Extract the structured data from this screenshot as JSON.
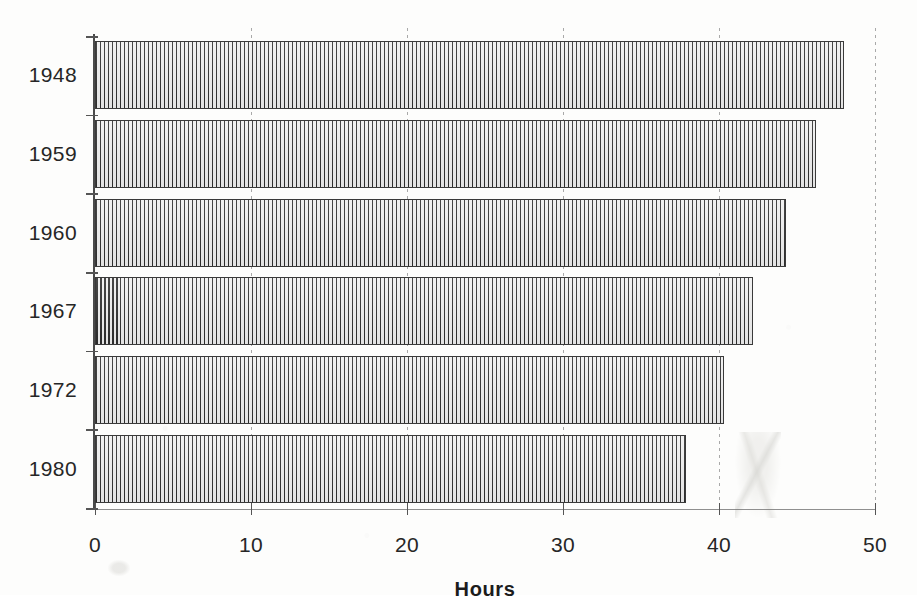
{
  "chart_data": {
    "type": "bar",
    "orientation": "horizontal",
    "title": "",
    "xlabel": "Hours",
    "ylabel": "",
    "categories": [
      "1948",
      "1959",
      "1960",
      "1967",
      "1972",
      "1980"
    ],
    "values": [
      48.0,
      46.2,
      44.3,
      42.2,
      40.3,
      37.9
    ],
    "xlim": [
      0,
      50
    ],
    "xticks": [
      0,
      10,
      20,
      30,
      40,
      50
    ],
    "xtick_labels": [
      "0",
      "10",
      "20",
      "30",
      "40",
      "50"
    ],
    "grid": "vertical-dotted",
    "legend": null,
    "series": [
      {
        "name": "Hours",
        "values": [
          48.0,
          46.2,
          44.3,
          42.2,
          40.3,
          37.9
        ]
      }
    ],
    "bar_fill": "vertical-hatch",
    "colors": {
      "bar_stroke": "#3a3a3a",
      "bar_hatch": "#2e2e2e",
      "bar_background": "#ededed",
      "axis": "#555555",
      "gridline": "#9a9a9a",
      "text": "#262626",
      "page": "#fdfdfc"
    }
  },
  "axis": {
    "x_title": "Hours"
  }
}
